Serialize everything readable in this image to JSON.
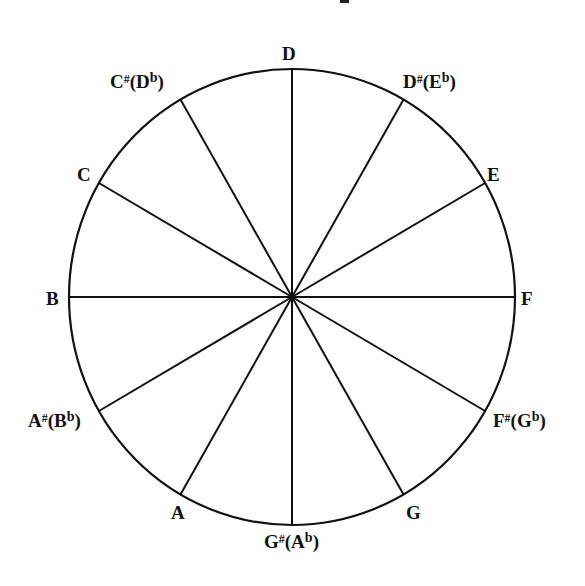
{
  "diagram": {
    "type": "note-circle",
    "center": [
      292,
      297
    ],
    "radius_x": 223,
    "radius_y": 228,
    "spoke_count": 12,
    "stroke_color": "#111111",
    "notes": [
      {
        "name": "D",
        "accidental": "",
        "alt": "",
        "alt_accidental": "",
        "angle": 0,
        "pos": [
          282,
          44
        ]
      },
      {
        "name": "D",
        "accidental": "#",
        "alt": "E",
        "alt_accidental": "b",
        "angle": 30,
        "pos": [
          403,
          72
        ]
      },
      {
        "name": "E",
        "accidental": "",
        "alt": "",
        "alt_accidental": "",
        "angle": 60,
        "pos": [
          487,
          165
        ]
      },
      {
        "name": "F",
        "accidental": "",
        "alt": "",
        "alt_accidental": "",
        "angle": 90,
        "pos": [
          521,
          289
        ]
      },
      {
        "name": "F",
        "accidental": "#",
        "alt": "G",
        "alt_accidental": "b",
        "angle": 120,
        "pos": [
          493,
          411
        ]
      },
      {
        "name": "G",
        "accidental": "",
        "alt": "",
        "alt_accidental": "",
        "angle": 150,
        "pos": [
          406,
          503
        ]
      },
      {
        "name": "G",
        "accidental": "#",
        "alt": "A",
        "alt_accidental": "b",
        "angle": 180,
        "pos": [
          264,
          532
        ]
      },
      {
        "name": "A",
        "accidental": "",
        "alt": "",
        "alt_accidental": "",
        "angle": 210,
        "pos": [
          171,
          503
        ]
      },
      {
        "name": "A",
        "accidental": "#",
        "alt": "B",
        "alt_accidental": "b",
        "angle": 240,
        "pos": [
          28,
          411
        ]
      },
      {
        "name": "B",
        "accidental": "",
        "alt": "",
        "alt_accidental": "",
        "angle": 270,
        "pos": [
          46,
          289
        ]
      },
      {
        "name": "C",
        "accidental": "",
        "alt": "",
        "alt_accidental": "",
        "angle": 300,
        "pos": [
          77,
          165
        ]
      },
      {
        "name": "C",
        "accidental": "#",
        "alt": "D",
        "alt_accidental": "b",
        "angle": 330,
        "pos": [
          110,
          72
        ]
      }
    ]
  }
}
